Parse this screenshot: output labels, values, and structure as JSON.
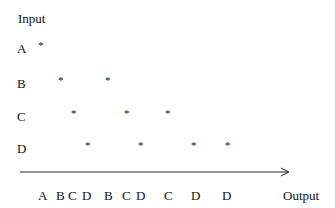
{
  "title": "Input",
  "output_label": "Output",
  "rows": [
    {
      "label": "A",
      "y": 42,
      "stars": [
        41
      ]
    },
    {
      "label": "B",
      "y": 77,
      "stars": [
        61,
        108
      ]
    },
    {
      "label": "C",
      "y": 110,
      "stars": [
        74,
        127,
        168
      ]
    },
    {
      "label": "D",
      "y": 142,
      "stars": [
        88,
        141,
        194,
        228
      ]
    }
  ],
  "star_glyph": "*",
  "output_sequence": [
    {
      "label": "A",
      "x": 38
    },
    {
      "label": "B",
      "x": 56
    },
    {
      "label": "C",
      "x": 68
    },
    {
      "label": "D",
      "x": 82
    },
    {
      "label": "B",
      "x": 104
    },
    {
      "label": "C",
      "x": 122
    },
    {
      "label": "D",
      "x": 136
    },
    {
      "label": "C",
      "x": 164
    },
    {
      "label": "D",
      "x": 191
    },
    {
      "label": "D",
      "x": 222
    }
  ]
}
